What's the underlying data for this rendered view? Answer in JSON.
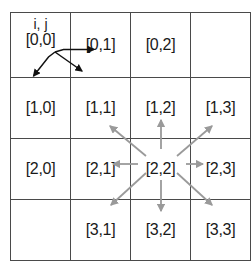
{
  "figure": {
    "type": "grid-diagram",
    "title": "",
    "axis_caption": "i, j",
    "rows": 4,
    "cols": 4,
    "colors": {
      "grid_line": "#4a4a4a",
      "label_text": "#1a1a1a",
      "axis_arrow": "#111111",
      "neighbor_arrow": "#9a9a9a",
      "background": "#ffffff"
    },
    "cells": [
      [
        {
          "label": "[0,0]",
          "empty": false,
          "name": "cell-0-0"
        },
        {
          "label": "[0,1]",
          "empty": false,
          "name": "cell-0-1"
        },
        {
          "label": "[0,2]",
          "empty": false,
          "name": "cell-0-2"
        },
        {
          "label": "",
          "empty": true,
          "name": "cell-0-3"
        }
      ],
      [
        {
          "label": "[1,0]",
          "empty": false,
          "name": "cell-1-0"
        },
        {
          "label": "[1,1]",
          "empty": false,
          "name": "cell-1-1"
        },
        {
          "label": "[1,2]",
          "empty": false,
          "name": "cell-1-2"
        },
        {
          "label": "[1,3]",
          "empty": false,
          "name": "cell-1-3"
        }
      ],
      [
        {
          "label": "[2,0]",
          "empty": false,
          "name": "cell-2-0"
        },
        {
          "label": "[2,1]",
          "empty": false,
          "name": "cell-2-1"
        },
        {
          "label": "[2,2]",
          "empty": false,
          "name": "cell-2-2"
        },
        {
          "label": "[2,3]",
          "empty": false,
          "name": "cell-2-3"
        }
      ],
      [
        {
          "label": "",
          "empty": true,
          "name": "cell-3-0"
        },
        {
          "label": "[3,1]",
          "empty": false,
          "name": "cell-3-1"
        },
        {
          "label": "[3,2]",
          "empty": false,
          "name": "cell-3-2"
        },
        {
          "label": "[3,3]",
          "empty": false,
          "name": "cell-3-3"
        }
      ]
    ],
    "axis_arrows": {
      "origin": "[0,0]",
      "j_direction": "right",
      "i_direction": "down",
      "description": "i increases downward, j increases rightward"
    },
    "neighbor_arrows": {
      "center": "[2,2]",
      "count": 8,
      "targets": [
        "[1,1]",
        "[1,2]",
        "[1,3]",
        "[2,1]",
        "[2,3]",
        "[3,1]",
        "[3,2]",
        "[3,3]"
      ],
      "directions": [
        "up-left",
        "up",
        "up-right",
        "left",
        "right",
        "down-left",
        "down",
        "down-right"
      ]
    }
  }
}
